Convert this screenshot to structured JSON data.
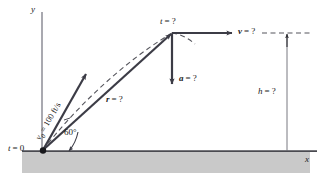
{
  "figure": {
    "type": "projectile-motion-diagram",
    "axes": {
      "y_label": "y",
      "x_label": "x"
    },
    "origin": {
      "label_t": "t",
      "label_eq": "= 0",
      "full": "t = 0"
    },
    "initial_velocity": {
      "symbol": "v",
      "subscript": "0",
      "equals": "=",
      "value": "100 ft/s",
      "full": "v0 = 100 ft/s"
    },
    "angle": {
      "value": "60",
      "unit": "°",
      "full": "60°"
    },
    "position_vector": {
      "symbol": "r",
      "value": "= ?",
      "full": "r = ?"
    },
    "apex_time": {
      "symbol": "t",
      "value": "= ?",
      "full": "t = ?"
    },
    "acceleration": {
      "symbol": "a",
      "value": "= ?",
      "full": "a = ?"
    },
    "velocity_apex": {
      "symbol": "v",
      "value": "= ?",
      "full": "v = ?"
    },
    "height": {
      "symbol": "h",
      "value": "= ?",
      "full": "h = ?"
    },
    "colors": {
      "ink": "#1a1a1a",
      "vector": "#3c3c46",
      "axis": "#8c8c96",
      "ground_fill": "#c9c9c9",
      "ground_line": "#4a4a50",
      "dashed": "#55555c"
    }
  }
}
